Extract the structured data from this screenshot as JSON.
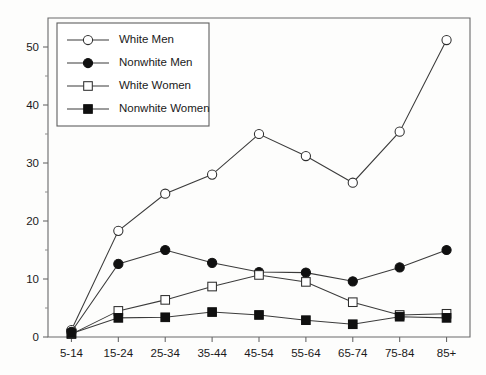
{
  "chart_data": {
    "type": "line",
    "title": "",
    "subtitle": "",
    "xlabel": "",
    "ylabel": "",
    "categories": [
      "5-14",
      "15-24",
      "25-34",
      "35-44",
      "45-54",
      "55-64",
      "65-74",
      "75-84",
      "85+"
    ],
    "ylim": [
      0,
      55
    ],
    "yticks": [
      0,
      10,
      20,
      30,
      40,
      50
    ],
    "ytick_labels": [
      "0",
      "10",
      "20",
      "30",
      "40",
      "50"
    ],
    "yminor_ticks": [
      5,
      15,
      25,
      35,
      45
    ],
    "grid": false,
    "legend_position": "upper left",
    "series": [
      {
        "name": "White Men",
        "marker": "open-circle",
        "values": [
          1.2,
          18.3,
          24.7,
          28.0,
          35.0,
          31.2,
          26.6,
          35.4,
          51.2
        ]
      },
      {
        "name": "Nonwhite Men",
        "marker": "filled-circle",
        "values": [
          0.9,
          12.6,
          15.0,
          12.8,
          11.2,
          11.1,
          9.6,
          12.0,
          15.0
        ]
      },
      {
        "name": "White Women",
        "marker": "open-square",
        "values": [
          0.5,
          4.5,
          6.4,
          8.7,
          10.7,
          9.5,
          6.0,
          3.8,
          4.0
        ]
      },
      {
        "name": "Nonwhite Women",
        "marker": "filled-square",
        "values": [
          0.6,
          3.3,
          3.4,
          4.3,
          3.8,
          2.9,
          2.2,
          3.5,
          3.3
        ]
      }
    ],
    "colors": {
      "line": "#3b3b3b",
      "marker_open_fill": "#ffffff",
      "marker_filled_fill": "#101010",
      "marker_stroke": "#2e2e2e",
      "axis": "#6a6a6a",
      "text": "#1a1a1a",
      "background": "#fdfdfc"
    }
  }
}
